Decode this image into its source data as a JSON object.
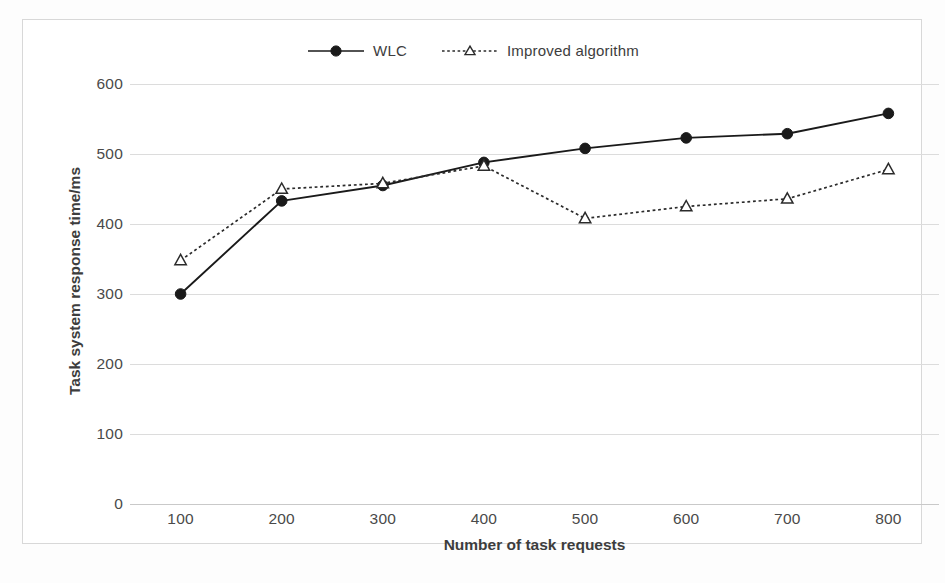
{
  "chart_data": {
    "type": "line",
    "title": "",
    "xlabel": "Number of task requests",
    "ylabel": "Task system response time/ms",
    "x": [
      100,
      200,
      300,
      400,
      500,
      600,
      700,
      800
    ],
    "categories": [
      "100",
      "200",
      "300",
      "400",
      "500",
      "600",
      "700",
      "800"
    ],
    "series": [
      {
        "name": "WLC",
        "values": [
          300,
          433,
          455,
          488,
          508,
          523,
          529,
          558
        ],
        "line_style": "solid",
        "marker": "filled-circle",
        "color": "#1a1a1a"
      },
      {
        "name": "Improved algorithm",
        "values": [
          348,
          450,
          458,
          483,
          408,
          425,
          436,
          478
        ],
        "line_style": "dotted",
        "marker": "open-triangle",
        "color": "#2b2b2b"
      }
    ],
    "ylim": [
      0,
      600
    ],
    "yticks": [
      0,
      100,
      200,
      300,
      400,
      500,
      600
    ],
    "ytick_labels": [
      "0",
      "100",
      "200",
      "300",
      "400",
      "500",
      "600"
    ],
    "xtick_labels": [
      "100",
      "200",
      "300",
      "400",
      "500",
      "600",
      "700",
      "800"
    ],
    "grid": true,
    "grid_axis": "y",
    "legend_position": "top-center",
    "legend_entries": [
      "WLC",
      "Improved algorithm"
    ]
  },
  "axes": {
    "x_title": "Number of task requests",
    "y_title": "Task system response time/ms"
  },
  "legend": {
    "items": [
      {
        "label": "WLC",
        "marker": "filled-circle-marker",
        "style": "solid"
      },
      {
        "label": "Improved algorithm",
        "marker": "open-triangle-marker",
        "style": "dotted"
      }
    ]
  },
  "colors": {
    "series_wlc": "#1a1a1a",
    "series_improved": "#2b2b2b",
    "gridline": "#dcdcdc",
    "frame_border": "#d8d8d8",
    "text": "#404040",
    "background": "#ffffff"
  }
}
